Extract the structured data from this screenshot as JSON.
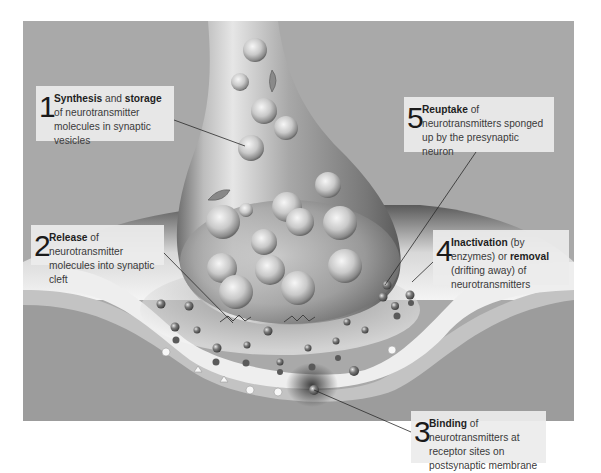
{
  "diagram": {
    "colors": {
      "panel_bg": "#a9a9a9",
      "postsynaptic": "#9c9c9c",
      "membrane_band": "#c4c4c4",
      "cleft": "#f2f2f2",
      "label_bg": "#ececec",
      "leader_line": "#2a2a2a"
    },
    "labels": [
      {
        "step": "1",
        "bold1": "Synthesis",
        "mid1": " and ",
        "bold2": "storage",
        "rest": " of neurotransmitter molecules in synaptic vesicles"
      },
      {
        "step": "2",
        "bold1": "Release",
        "rest": " of neurotransmitter molecules into synaptic cleft"
      },
      {
        "step": "3",
        "bold1": "Binding",
        "rest": " of neurotransmitters at receptor sites on postsynaptic membrane"
      },
      {
        "step": "4",
        "bold1": "Inactivation",
        "mid1": " (by enzymes) or ",
        "bold2": "removal",
        "rest": " (drifting away) of neurotransmitters"
      },
      {
        "step": "5",
        "bold1": "Reuptake",
        "rest": " of neurotransmitters sponged up by the presynaptic neuron"
      }
    ],
    "structures": [
      "presynaptic axon terminal",
      "synaptic vesicles",
      "synaptic cleft",
      "neurotransmitter molecules",
      "receptor sites",
      "postsynaptic membrane"
    ]
  }
}
